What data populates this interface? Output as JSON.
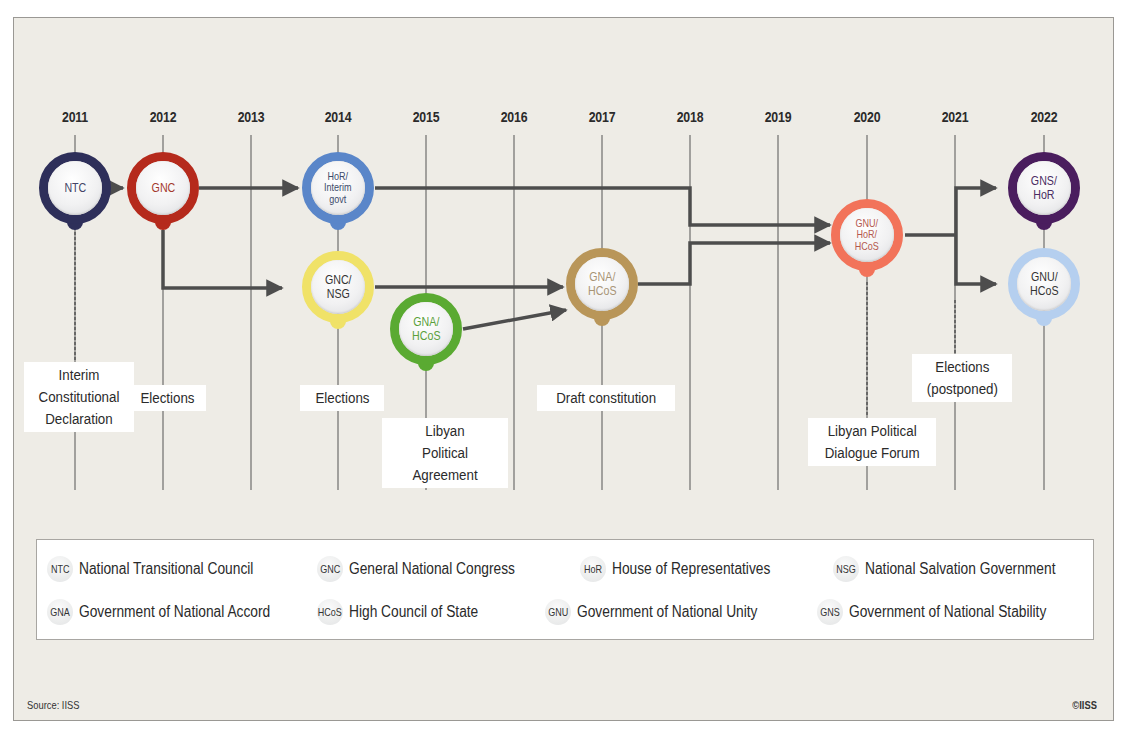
{
  "chart_data": {
    "type": "timeline",
    "title": "",
    "years": [
      "2011",
      "2012",
      "2013",
      "2014",
      "2015",
      "2016",
      "2017",
      "2018",
      "2019",
      "2020",
      "2021",
      "2022"
    ],
    "nodes": [
      {
        "id": "ntc",
        "label": "NTC",
        "year": "2011",
        "row": "top",
        "color": "#2e2f5a",
        "text_color": "#444466"
      },
      {
        "id": "gnc",
        "label": "GNC",
        "year": "2012",
        "row": "top",
        "color": "#b52a1c",
        "text_color": "#a3392d"
      },
      {
        "id": "hor",
        "label": "HoR/\nInterim\ngovt",
        "year": "2014",
        "row": "top",
        "color": "#5a86c9",
        "text_color": "#3c4a6a"
      },
      {
        "id": "gncnsg",
        "label": "GNC/\nNSG",
        "year": "2014",
        "row": "middle",
        "color": "#f0e268",
        "text_color": "#333333"
      },
      {
        "id": "gna",
        "label": "GNA/\nHCoS",
        "year": "2015",
        "row": "lower",
        "color": "#5aaa32",
        "text_color": "#5aa03a"
      },
      {
        "id": "gnahcos",
        "label": "GNA/\nHCoS",
        "year": "2017",
        "row": "middle",
        "color": "#b99659",
        "text_color": "#a89476"
      },
      {
        "id": "gnuhor",
        "label": "GNU/\nHoR/\nHCoS",
        "year": "2020",
        "row": "upper-middle",
        "color": "#f2735a",
        "text_color": "#b4584e"
      },
      {
        "id": "gns",
        "label": "GNS/\nHoR",
        "year": "2022",
        "row": "top",
        "color": "#4a1d5e",
        "text_color": "#4a2c62"
      },
      {
        "id": "gnu",
        "label": "GNU/\nHCoS",
        "year": "2022",
        "row": "middle",
        "color": "#b5cfef",
        "text_color": "#333333"
      }
    ],
    "links": [
      [
        "ntc",
        "gnc"
      ],
      [
        "gnc",
        "hor"
      ],
      [
        "gnc",
        "gncnsg"
      ],
      [
        "hor",
        "gnuhor"
      ],
      [
        "gncnsg",
        "gnahcos"
      ],
      [
        "gna",
        "gnahcos"
      ],
      [
        "gnahcos",
        "gnuhor"
      ],
      [
        "gnuhor",
        "gns"
      ],
      [
        "gnuhor",
        "gnu"
      ]
    ],
    "events": [
      {
        "year": "2011",
        "text": "Interim\nConstitutional\nDeclaration"
      },
      {
        "year": "2012",
        "text": "Elections"
      },
      {
        "year": "2014",
        "text": "Elections"
      },
      {
        "year": "2015",
        "text": "Libyan\nPolitical Agreement"
      },
      {
        "year": "2017",
        "text": "Draft constitution"
      },
      {
        "year": "2020",
        "text": "Libyan Political\nDialogue Forum"
      },
      {
        "year": "2021",
        "text": "Elections\n(postponed)"
      }
    ]
  },
  "legend": [
    {
      "abbr": "NTC",
      "name": "National Transitional Council"
    },
    {
      "abbr": "GNC",
      "name": "General National Congress"
    },
    {
      "abbr": "HoR",
      "name": "House of Representatives"
    },
    {
      "abbr": "NSG",
      "name": "National Salvation Government"
    },
    {
      "abbr": "GNA",
      "name": "Government of National Accord"
    },
    {
      "abbr": "HCoS",
      "name": "High Council of State"
    },
    {
      "abbr": "GNU",
      "name": "Government of National Unity"
    },
    {
      "abbr": "GNS",
      "name": "Government of National Stability"
    }
  ],
  "footer": {
    "source": "Source: IISS",
    "copyright": "©IISS"
  }
}
